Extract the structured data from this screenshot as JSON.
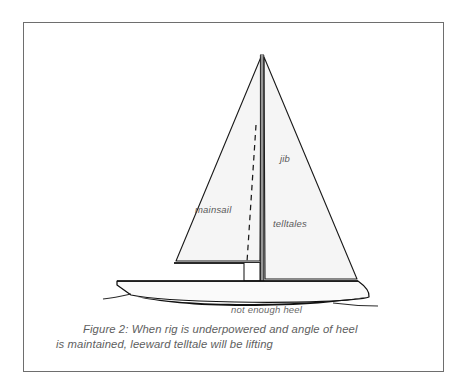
{
  "figure": {
    "caption_line_1": "Figure 2: When rig is underpowered and angle of heel",
    "caption_line_2": "is maintained, leeward telltale will be lifting",
    "caption_full": "Figure 2: When rig is underpowered and angle of heel is maintained, leeward telltale will be lifting"
  },
  "labels": {
    "mainsail": "mainsail",
    "jib": "jib",
    "telltales": "telltales",
    "not_enough_heel": "not enough heel"
  },
  "colors": {
    "frame_border": "#6e6e6e",
    "page_background": "#ffffff",
    "sail_fill": "#f5f5f5",
    "sail_outline": "#1a1a1a",
    "hull_fill": "#fafafa",
    "hull_outline": "#111111",
    "keel_shadow": "#111111",
    "mast": "#3a3a3a",
    "dashed_line": "#1a1a1a",
    "waterline": "#2b2b2b",
    "label_text": "#5a5a5a",
    "caption_text": "#5e5e5e"
  },
  "geometry": {
    "frame": {
      "x": 23,
      "y": 22,
      "width": 421,
      "height": 350
    },
    "masthead": {
      "x": 262,
      "y": 54
    },
    "mast_base": {
      "x": 262,
      "y": 282
    },
    "mainsail_tack": {
      "x": 174,
      "y": 263
    },
    "jib_clew": {
      "x": 357,
      "y": 280
    },
    "deck_left": {
      "x": 117,
      "y": 281
    },
    "deck_right": {
      "x": 358,
      "y": 281
    },
    "waterline_left": {
      "x": 103,
      "y": 299
    },
    "waterline_right": {
      "x": 378,
      "y": 306
    }
  }
}
